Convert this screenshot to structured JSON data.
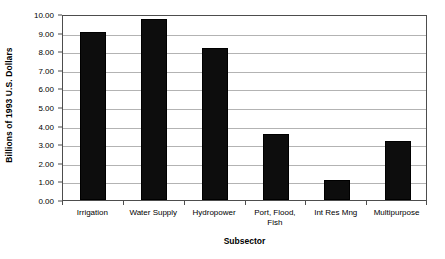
{
  "chart_data": {
    "type": "bar",
    "title": "",
    "categories": [
      "Irrigation",
      "Water Supply",
      "Hydropower",
      "Port, Flood, Fish",
      "Int Res Mng",
      "Multipurpose"
    ],
    "category_lines": [
      [
        "Irrigation"
      ],
      [
        "Water Supply"
      ],
      [
        "Hydropower"
      ],
      [
        "Port, Flood,",
        "Fish"
      ],
      [
        "Int Res Mng"
      ],
      [
        "Multipurpose"
      ]
    ],
    "values": [
      9.05,
      9.75,
      8.15,
      3.55,
      1.1,
      3.15
    ],
    "xlabel": "Subsector",
    "ylabel": "Billions of 1993 U.S. Dollars",
    "ylim": [
      0,
      10
    ],
    "ytick_step": 1,
    "ytick_labels": [
      "0.00",
      "1.00",
      "2.00",
      "3.00",
      "4.00",
      "5.00",
      "6.00",
      "7.00",
      "8.00",
      "9.00",
      "10.00"
    ],
    "ytick_values": [
      0,
      1,
      2,
      3,
      4,
      5,
      6,
      7,
      8,
      9,
      10
    ],
    "grid": true,
    "grid_orientation": "horizontal",
    "legend": null,
    "bar_color": "#0d0d0d",
    "grid_color": "#b3b3b3",
    "frame_color": "#4d4d4d",
    "background_color": "#ffffff"
  }
}
